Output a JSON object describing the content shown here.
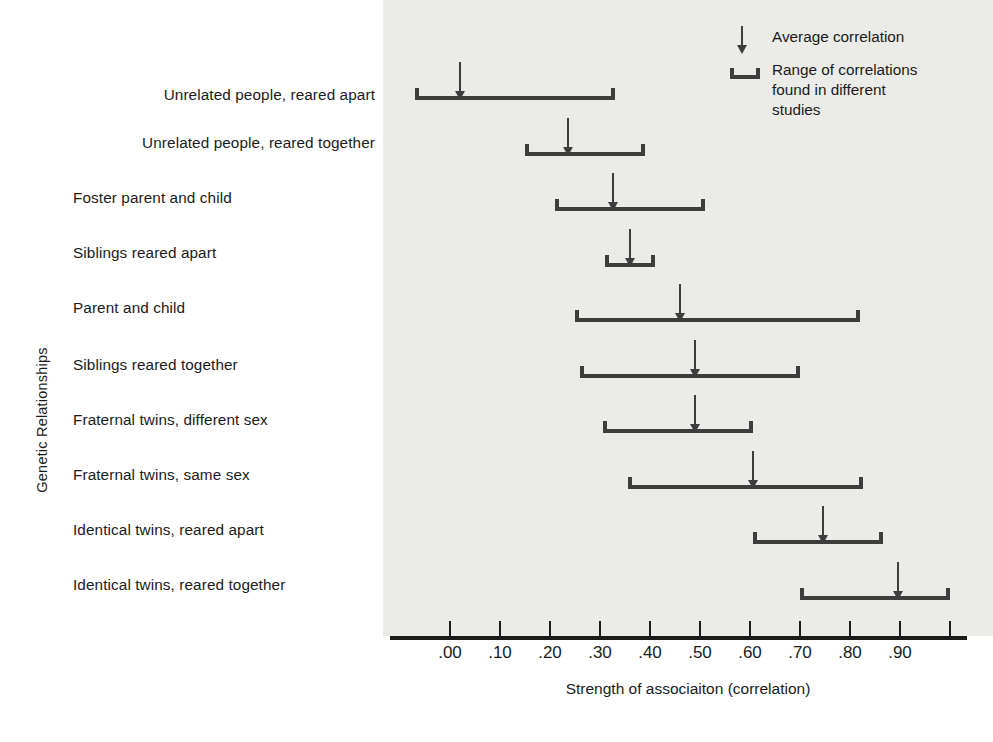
{
  "chart_data": {
    "type": "bar",
    "title": "",
    "xlabel": "Strength of associaiton (correlation)",
    "ylabel": "Genetic Relationships",
    "xlim": [
      -0.1,
      1.0
    ],
    "grid": false,
    "legend_position": "top-right",
    "tick_labels": [
      ".00",
      ".10",
      ".20",
      ".30",
      ".40",
      ".50",
      ".60",
      ".70",
      ".80",
      ".90"
    ],
    "tick_values": [
      0.0,
      0.1,
      0.2,
      0.3,
      0.4,
      0.5,
      0.6,
      0.7,
      0.8,
      0.9
    ],
    "categories": [
      "Unrelated people, reared apart",
      "Unrelated people, reared together",
      "Foster parent and child",
      "Siblings reared apart",
      "Parent and child",
      "Siblings reared together",
      "Fraternal twins, different sex",
      "Fraternal twins, same sex",
      "Identical twins, reared apart",
      "Identical twins, reared together"
    ],
    "series": [
      {
        "name": "Range of correlations found in different studies",
        "ranges": [
          [
            -0.07,
            0.33
          ],
          [
            0.15,
            0.39
          ],
          [
            0.21,
            0.51
          ],
          [
            0.31,
            0.41
          ],
          [
            0.25,
            0.82
          ],
          [
            0.26,
            0.7
          ],
          [
            0.305,
            0.605
          ],
          [
            0.355,
            0.825
          ],
          [
            0.605,
            0.865
          ],
          [
            0.7,
            1.0
          ]
        ]
      },
      {
        "name": "Average correlation",
        "values": [
          0.02,
          0.235,
          0.325,
          0.36,
          0.46,
          0.49,
          0.49,
          0.605,
          0.745,
          0.895
        ]
      }
    ],
    "colors": {
      "panel_background": "#ebebe8",
      "mark": "#3d3d3d",
      "axis": "#1b1b1b",
      "text": "#1b1b1b"
    }
  },
  "legend": {
    "items": [
      {
        "symbol": "down-arrow",
        "label": "Average correlation"
      },
      {
        "symbol": "range-bracket",
        "label_line1": "Range of correlations",
        "label_line2": "found in different",
        "label_line3": "studies"
      }
    ]
  }
}
